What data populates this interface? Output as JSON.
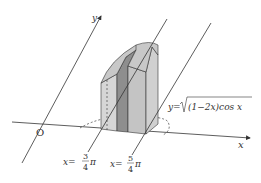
{
  "diagram": {
    "type": "3d-solid-with-cross-sections",
    "axes": {
      "x_label": "x",
      "y_label": "y",
      "origin_label": "O"
    },
    "curve_label": {
      "prefix": "y=",
      "radicand": "(1−2x)cos x"
    },
    "boundary_lines": [
      {
        "label_var": "x=",
        "num": "3",
        "den": "4",
        "suffix": "π"
      },
      {
        "label_var": "x=",
        "num": "5",
        "den": "4",
        "suffix": "π"
      }
    ],
    "colors": {
      "line": "#333333",
      "face_light": "#d6d6d6",
      "face_mid": "#bdbdbd",
      "face_dark": "#8e8e8e",
      "top_face": "#c8c8c8"
    }
  }
}
